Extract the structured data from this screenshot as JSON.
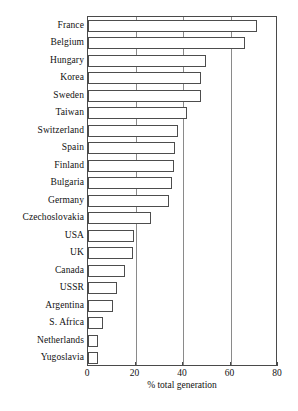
{
  "chart_data": {
    "type": "bar",
    "orientation": "horizontal",
    "title": "",
    "xlabel": "% total generation",
    "ylabel": "",
    "xlim": [
      0,
      80
    ],
    "xticks": [
      0,
      20,
      40,
      60,
      80
    ],
    "xtick_labels": [
      "0",
      "20",
      "40",
      "60",
      "80"
    ],
    "grid": "vertical",
    "legend": "none",
    "categories": [
      "France",
      "Belgium",
      "Hungary",
      "Korea",
      "Sweden",
      "Taiwan",
      "Switzerland",
      "Spain",
      "Finland",
      "Bulgaria",
      "Germany",
      "Czechoslovakia",
      "USA",
      "UK",
      "Canada",
      "USSR",
      "Argentina",
      "S. Africa",
      "Netherlands",
      "Yugoslavia"
    ],
    "values": [
      71.0,
      66.0,
      49.5,
      47.5,
      47.5,
      41.5,
      37.8,
      36.5,
      36.2,
      35.5,
      34.0,
      26.5,
      19.2,
      18.8,
      15.5,
      12.0,
      10.5,
      6.3,
      4.3,
      4.2
    ],
    "bar_facecolor": "#ffffff",
    "bar_edgecolor": "#4d4d4d"
  },
  "axis": {
    "xlabel": "% total generation"
  },
  "caption": {
    "text": ""
  }
}
